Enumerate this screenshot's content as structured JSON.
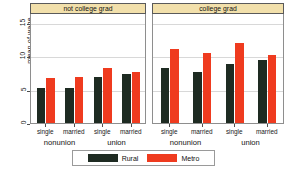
{
  "chart_data": {
    "type": "bar",
    "title": "",
    "xlabel": "",
    "ylabel": "mean of wage",
    "ylim": [
      0,
      16.5
    ],
    "yticks": [
      "0",
      "5",
      "10",
      "15"
    ],
    "ytick_values": [
      0,
      5,
      10,
      15
    ],
    "grid": true,
    "legend": {
      "position": "bottom",
      "entries": [
        {
          "name": "Rural",
          "color": "#1e2b22"
        },
        {
          "name": "Metro",
          "color": "#ef3b1f"
        }
      ]
    },
    "panels": [
      {
        "strip_label": "not college grad",
        "groups": [
          {
            "label": "nonunion",
            "categories": [
              "single",
              "married"
            ],
            "series": [
              {
                "name": "Rural",
                "values": [
                  5.2,
                  5.2
                ]
              },
              {
                "name": "Metro",
                "values": [
                  6.8,
                  6.9
                ]
              }
            ]
          },
          {
            "label": "union",
            "categories": [
              "single",
              "married"
            ],
            "series": [
              {
                "name": "Rural",
                "values": [
                  6.9,
                  7.3
                ]
              },
              {
                "name": "Metro",
                "values": [
                  8.3,
                  7.7
                ]
              }
            ]
          }
        ]
      },
      {
        "strip_label": "college grad",
        "groups": [
          {
            "label": "nonunion",
            "categories": [
              "single",
              "married"
            ],
            "series": [
              {
                "name": "Rural",
                "values": [
                  8.2,
                  7.7
                ]
              },
              {
                "name": "Metro",
                "values": [
                  11.1,
                  10.5
                ]
              }
            ]
          },
          {
            "label": "union",
            "categories": [
              "single",
              "married"
            ],
            "series": [
              {
                "name": "Rural",
                "values": [
                  8.9,
                  9.4
                ]
              },
              {
                "name": "Metro",
                "values": [
                  12.0,
                  10.2
                ]
              }
            ]
          }
        ]
      }
    ]
  },
  "colors": {
    "rural": "#1e2b22",
    "metro": "#ef3b1f",
    "strip_background": "#f2e0ab",
    "grid": "#d8d8d8",
    "axis": "#8e8e8e"
  }
}
